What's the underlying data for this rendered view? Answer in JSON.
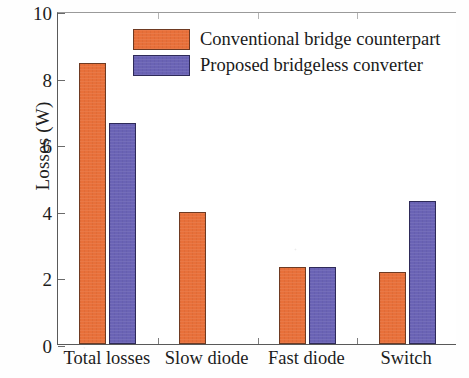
{
  "chart_data": {
    "type": "bar",
    "title": "",
    "xlabel": "",
    "ylabel": "Losses (W)",
    "ylim": [
      0,
      10
    ],
    "ytick_values": [
      0,
      2,
      4,
      6,
      8,
      10
    ],
    "ytick_labels": [
      "0",
      "2",
      "4",
      "6",
      "8",
      "10"
    ],
    "grid": false,
    "legend_position": "top-center",
    "categories": [
      "Total losses",
      "Slow diode",
      "Fast diode",
      "Switch"
    ],
    "series": [
      {
        "name": "Conventional bridge counterpart",
        "color": "#e8703a",
        "values": [
          8.45,
          3.95,
          2.3,
          2.15
        ]
      },
      {
        "name": "Proposed bridgeless converter",
        "color": "#6a63b5",
        "values": [
          6.65,
          0,
          2.3,
          4.3
        ]
      }
    ]
  },
  "axes": {
    "y_title": "Losses (W)"
  },
  "legend": {
    "entries": [
      {
        "label": "Conventional bridge counterpart",
        "color": "#e8703a"
      },
      {
        "label": "Proposed bridgeless converter",
        "color": "#6a63b5"
      }
    ]
  }
}
